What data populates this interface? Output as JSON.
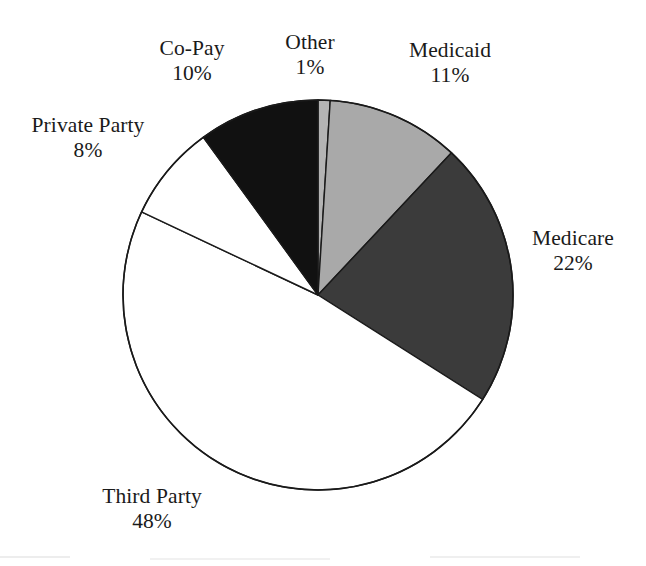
{
  "chart_data": {
    "type": "pie",
    "title": "",
    "subtitle": "",
    "xlabel": "",
    "ylabel": "",
    "legend_position": "none",
    "grid": false,
    "start_angle_deg": 0,
    "direction": "clockwise",
    "center": {
      "cx": 318,
      "cy": 295,
      "r": 195
    },
    "categories": [
      "Other",
      "Medicaid",
      "Medicare",
      "Third Party",
      "Private Party",
      "Co-Pay"
    ],
    "values": [
      1,
      11,
      22,
      48,
      8,
      10
    ],
    "units": "percent",
    "slices": [
      {
        "name": "Other",
        "value": 1,
        "value_label": "1%",
        "color": "#b4b4b4",
        "start_deg": 0,
        "end_deg": 3.6,
        "label_name": "Other",
        "label_value": "1%"
      },
      {
        "name": "Medicaid",
        "value": 11,
        "value_label": "11%",
        "color": "#a9a9a9",
        "start_deg": 3.6,
        "end_deg": 43.2,
        "label_name": "Medicaid",
        "label_value": "11%"
      },
      {
        "name": "Medicare",
        "value": 22,
        "value_label": "22%",
        "color": "#3b3b3b",
        "start_deg": 43.2,
        "end_deg": 122.4,
        "label_name": "Medicare",
        "label_value": "22%"
      },
      {
        "name": "Third Party",
        "value": 48,
        "value_label": "48%",
        "color": "#ffffff",
        "start_deg": 122.4,
        "end_deg": 295.2,
        "label_name": "Third Party",
        "label_value": "48%"
      },
      {
        "name": "Private Party",
        "value": 8,
        "value_label": "8%",
        "color": "#ffffff",
        "start_deg": 295.2,
        "end_deg": 324.0,
        "label_name": "Private Party",
        "label_value": "8%"
      },
      {
        "name": "Co-Pay",
        "value": 10,
        "value_label": "10%",
        "color": "#111111",
        "start_deg": 324.0,
        "end_deg": 360.0,
        "label_name": "Co-Pay",
        "label_value": "10%"
      }
    ],
    "stroke_color": "#1a1a1a",
    "background_color": "#ffffff"
  }
}
